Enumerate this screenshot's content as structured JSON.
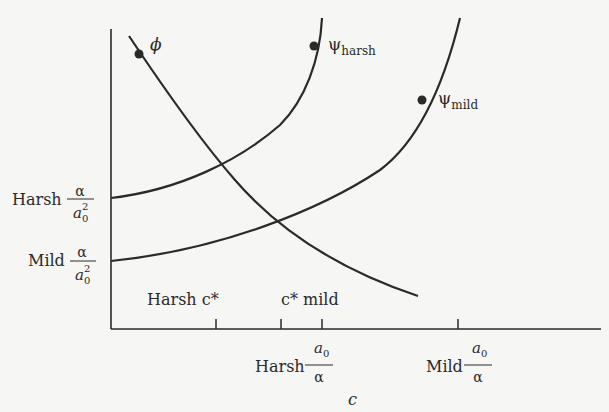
{
  "diagram": {
    "x_axis_label": "c",
    "curves": {
      "phi": {
        "label": "ϕ"
      },
      "psi_harsh": {
        "symbol": "ψ",
        "sub": "harsh"
      },
      "psi_mild": {
        "symbol": "ψ",
        "sub": "mild"
      }
    },
    "y_labels": {
      "harsh": {
        "word": "Harsh",
        "num": "α",
        "den": "a",
        "den_sub": "0",
        "den_sup": "2"
      },
      "mild": {
        "word": "Mild",
        "num": "α",
        "den": "a",
        "den_sub": "0",
        "den_sup": "2"
      }
    },
    "x_labels_above": {
      "harsh_c_star": "Harsh c*",
      "c_star_mild": "c* mild"
    },
    "x_labels_below": {
      "harsh": {
        "word": "Harsh",
        "num": "a",
        "num_sub": "0",
        "den": "α"
      },
      "mild": {
        "word": "Mild",
        "num": "a",
        "num_sub": "0",
        "den": "α"
      }
    },
    "colors": {
      "ink": "#2a2a2a",
      "background": "#f6f6f4"
    }
  }
}
